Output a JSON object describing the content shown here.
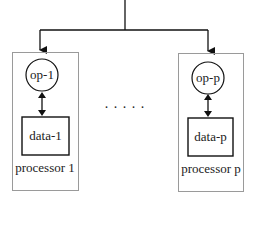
{
  "diagram": {
    "processors": [
      {
        "op_label": "op-1",
        "data_label": "data-1",
        "processor_label": "processor 1"
      },
      {
        "op_label": "op-p",
        "data_label": "data-p",
        "processor_label": "processor p"
      }
    ],
    "ellipsis": ". . . . .",
    "colors": {
      "line": "#111111",
      "box_border": "#9a9a9a"
    }
  }
}
